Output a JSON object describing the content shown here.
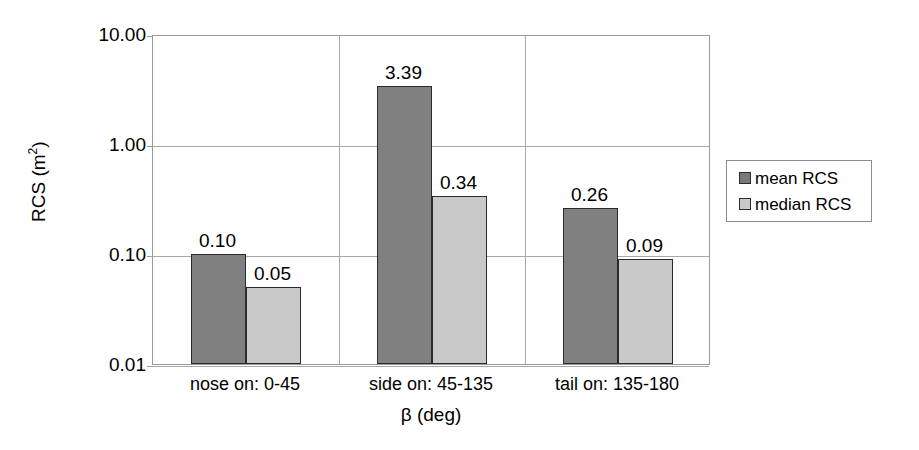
{
  "chart_data": {
    "type": "bar",
    "title": "",
    "xlabel": "β (deg)",
    "ylabel": "RCS (m²)",
    "ylabel_base": "RCS (m",
    "ylabel_sup": "2",
    "ylabel_tail": ")",
    "yscale": "log",
    "ylim": [
      0.01,
      10.0
    ],
    "ytick_labels": [
      "10.00",
      "1.00",
      "0.10",
      "0.01"
    ],
    "ytick_values": [
      10.0,
      1.0,
      0.1,
      0.01
    ],
    "grid": "horizontal-and-category-dividers",
    "legend_position": "right",
    "categories": [
      "nose on:  0-45",
      "side on: 45-135",
      "tail on: 135-180"
    ],
    "series": [
      {
        "name": "mean RCS",
        "color": "#808080",
        "values": [
          0.1,
          3.39,
          0.26
        ],
        "labels": [
          "0.10",
          "3.39",
          "0.26"
        ]
      },
      {
        "name": "median RCS",
        "color": "#c9c9c9",
        "values": [
          0.05,
          0.34,
          0.09
        ],
        "labels": [
          "0.05",
          "0.34",
          "0.09"
        ]
      }
    ]
  },
  "legend": {
    "entries": [
      {
        "label": "mean RCS",
        "swatch": "mean"
      },
      {
        "label": "median RCS",
        "swatch": "median"
      }
    ]
  },
  "colors": {
    "mean_bar": "#808080",
    "median_bar": "#c9c9c9",
    "bar_outline": "#2b2b2b",
    "gridline": "#a8a8a8",
    "frame": "#9a9a9a",
    "text": "#000000",
    "background": "#ffffff"
  }
}
